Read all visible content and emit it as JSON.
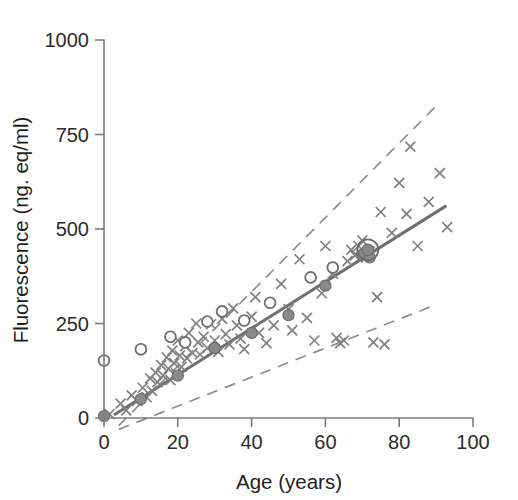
{
  "chart_data": {
    "type": "scatter",
    "title": "",
    "xlabel": "Age (years)",
    "ylabel": "Fluorescence (ng. eq/ml)",
    "xlim": [
      0,
      100
    ],
    "ylim": [
      0,
      1000
    ],
    "xticks": [
      0,
      20,
      40,
      60,
      80,
      100
    ],
    "yticks": [
      0,
      250,
      500,
      750,
      1000
    ],
    "xticklabels": [
      "0",
      "20",
      "40",
      "60",
      "80",
      "100"
    ],
    "yticklabels": [
      "0",
      "250",
      "500",
      "750",
      "1000"
    ],
    "grid": false,
    "legend": "none",
    "series": [
      {
        "name": "individual-measurements",
        "marker": "cross",
        "color": "#808080",
        "points": [
          [
            1.5,
            10
          ],
          [
            4.5,
            38
          ],
          [
            6.0,
            20
          ],
          [
            7.5,
            60
          ],
          [
            9.0,
            45
          ],
          [
            10.5,
            80
          ],
          [
            11.5,
            55
          ],
          [
            12.5,
            105
          ],
          [
            13.0,
            72
          ],
          [
            14.0,
            120
          ],
          [
            14.5,
            95
          ],
          [
            15.5,
            140
          ],
          [
            16.0,
            112
          ],
          [
            17.0,
            160
          ],
          [
            17.5,
            130
          ],
          [
            18.0,
            100
          ],
          [
            18.5,
            178
          ],
          [
            19.0,
            145
          ],
          [
            19.5,
            118
          ],
          [
            20.0,
            205
          ],
          [
            20.5,
            165
          ],
          [
            21.0,
            135
          ],
          [
            22.0,
            190
          ],
          [
            22.5,
            158
          ],
          [
            23.0,
            225
          ],
          [
            24.0,
            172
          ],
          [
            25.0,
            250
          ],
          [
            25.5,
            200
          ],
          [
            26.0,
            168
          ],
          [
            27.0,
            215
          ],
          [
            28.0,
            185
          ],
          [
            29.0,
            248
          ],
          [
            30.0,
            205
          ],
          [
            31.0,
            175
          ],
          [
            32.0,
            262
          ],
          [
            33.0,
            222
          ],
          [
            34.0,
            195
          ],
          [
            35.0,
            290
          ],
          [
            36.0,
            245
          ],
          [
            37.0,
            210
          ],
          [
            38.0,
            182
          ],
          [
            40.0,
            268
          ],
          [
            41.0,
            320
          ],
          [
            42.0,
            225
          ],
          [
            44.0,
            198
          ],
          [
            46.0,
            245
          ],
          [
            48.0,
            355
          ],
          [
            50.0,
            288
          ],
          [
            51.0,
            232
          ],
          [
            53.0,
            420
          ],
          [
            55.0,
            265
          ],
          [
            57.0,
            205
          ],
          [
            59.0,
            330
          ],
          [
            60.0,
            455
          ],
          [
            62.0,
            382
          ],
          [
            63.0,
            212
          ],
          [
            64.0,
            198
          ],
          [
            65.0,
            205
          ],
          [
            66.0,
            415
          ],
          [
            67.0,
            445
          ],
          [
            68.0,
            430
          ],
          [
            69.0,
            455
          ],
          [
            70.0,
            470
          ],
          [
            71.0,
            425
          ],
          [
            72.0,
            440
          ],
          [
            73.0,
            200
          ],
          [
            74.0,
            320
          ],
          [
            75.0,
            545
          ],
          [
            76.0,
            195
          ],
          [
            78.0,
            490
          ],
          [
            80.0,
            622
          ],
          [
            82.0,
            540
          ],
          [
            83.0,
            718
          ],
          [
            85.0,
            455
          ],
          [
            88.0,
            572
          ],
          [
            91.0,
            648
          ],
          [
            93.0,
            505
          ]
        ]
      },
      {
        "name": "group-means-filled",
        "marker": "filled-circle",
        "color": "#8a8a8a",
        "points": [
          [
            0,
            5
          ],
          [
            10,
            50
          ],
          [
            20,
            112
          ],
          [
            30,
            185
          ],
          [
            40,
            225
          ],
          [
            50,
            272
          ],
          [
            60,
            350
          ],
          [
            70,
            432
          ],
          [
            72,
            425
          ]
        ]
      },
      {
        "name": "group-values-open",
        "marker": "open-circle",
        "color": "#6e6e6e",
        "points": [
          [
            0,
            152
          ],
          [
            10,
            182
          ],
          [
            18,
            215
          ],
          [
            22,
            200
          ],
          [
            28,
            255
          ],
          [
            32,
            282
          ],
          [
            38,
            258
          ],
          [
            45,
            305
          ],
          [
            56,
            372
          ],
          [
            62,
            398
          ]
        ]
      },
      {
        "name": "highlighted-subject",
        "marker": "ringed-filled-circle",
        "color": "#6a6a6a",
        "points": [
          [
            71.5,
            445
          ]
        ]
      }
    ],
    "regression_line": {
      "name": "regression-fit",
      "color": "#6f6f6f",
      "style": "solid",
      "x": [
        3.0,
        92.5
      ],
      "y": [
        10,
        560
      ]
    },
    "prediction_bands": [
      {
        "name": "upper-prediction-band",
        "color": "#8d8d8d",
        "style": "dashed",
        "x": [
          4.0,
          91.0
        ],
        "y": [
          -20,
          835
        ]
      },
      {
        "name": "lower-prediction-band",
        "color": "#8d8d8d",
        "style": "dashed",
        "x": [
          4.0,
          90.0
        ],
        "y": [
          -30,
          300
        ]
      }
    ]
  },
  "axes": {
    "x_title": "Age (years)",
    "y_title": "Fluorescence (ng. eq/ml)",
    "x_labels": [
      "0",
      "20",
      "40",
      "60",
      "80",
      "100"
    ],
    "y_labels": [
      "0",
      "250",
      "500",
      "750",
      "1000"
    ]
  },
  "colors": {
    "axis": "#7b7b7b",
    "text": "#1f1f1f",
    "fit": "#6f6f6f",
    "band": "#8d8d8d",
    "cross": "#808080",
    "filled": "#8a8a8a",
    "open": "#6e6e6e",
    "background": "#ffffff"
  }
}
